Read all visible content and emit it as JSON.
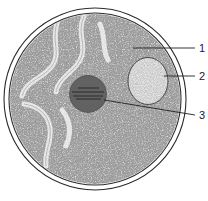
{
  "figure": {
    "type": "scientific-line-illustration",
    "background_color": "#ffffff",
    "ink_color": "#2b2b2b",
    "stipple_color": "#555555",
    "canvas": {
      "width": 208,
      "height": 201
    }
  },
  "structures": {
    "nuclear_envelope": {
      "name": "nuclear-envelope",
      "shape": "double-circle",
      "outer": {
        "cx": 95,
        "cy": 99,
        "r": 91
      },
      "inner": {
        "cx": 95,
        "cy": 99,
        "r": 86
      }
    },
    "nucleoplasm": {
      "name": "nucleoplasm",
      "fill": "stipple",
      "cx": 95,
      "cy": 99,
      "r": 86
    },
    "vesicle": {
      "name": "inner-vesicle",
      "shape": "ellipse",
      "cx": 148,
      "cy": 81,
      "rx": 21,
      "ry": 24
    },
    "nucleolus": {
      "name": "nucleolus",
      "shape": "dark-stippled-blob",
      "cx": 88,
      "cy": 94,
      "r": 19
    },
    "chromatin_channels": {
      "name": "chromatin-channels",
      "description": "faint lighter winding channels in upper-left nucleoplasm"
    }
  },
  "labels": [
    {
      "id": "label-1",
      "number": "1",
      "text_x": 199,
      "text_y": 52,
      "leader": {
        "x1": 133,
        "y1": 48,
        "x2": 195,
        "y2": 48
      },
      "points_to": "nucleoplasm"
    },
    {
      "id": "label-2",
      "number": "2",
      "text_x": 199,
      "text_y": 80,
      "leader": {
        "x1": 164,
        "y1": 76,
        "x2": 195,
        "y2": 76
      },
      "points_to": "inner-vesicle"
    },
    {
      "id": "label-3",
      "number": "3",
      "text_x": 199,
      "text_y": 119,
      "leader": {
        "x1": 104,
        "y1": 100,
        "x2": 195,
        "y2": 115
      },
      "points_to": "nucleolus"
    }
  ]
}
